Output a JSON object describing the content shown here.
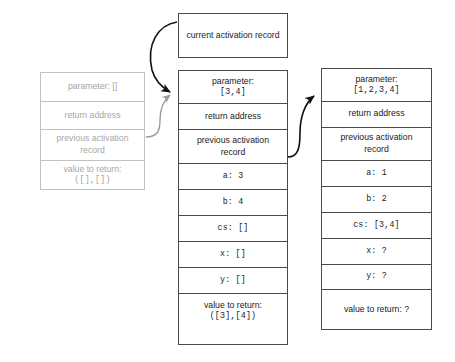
{
  "diagram": {
    "title_box": {
      "label": "current activation record"
    },
    "colors": {
      "active_border": "#4a4a4a",
      "ghost_border": "#c2c2c2",
      "active_text": "#1b1b1b",
      "ghost_text": "#a6a6a6",
      "arrow_black": "#111111",
      "arrow_grey": "#9b9b9b",
      "background": "#ffffff"
    },
    "frames": [
      {
        "name": "inactive-activation-record",
        "state": "inactive",
        "rows": [
          {
            "name": "parameter",
            "text": "parameter: []",
            "mono_tail": "[]"
          },
          {
            "name": "return-address",
            "text": "return address"
          },
          {
            "name": "previous-activation-record",
            "line1": "previous activation",
            "line2": "record"
          },
          {
            "name": "value-to-return",
            "line1": "value to return:",
            "line2": "([],[])"
          }
        ]
      },
      {
        "name": "middle-activation-record",
        "state": "active",
        "rows": [
          {
            "name": "parameter",
            "line1": "parameter:",
            "line2": "[3,4]"
          },
          {
            "name": "return-address",
            "text": "return address"
          },
          {
            "name": "previous-activation-record",
            "line1": "previous activation",
            "line2": "record"
          },
          {
            "name": "var-a",
            "text": "a: 3"
          },
          {
            "name": "var-b",
            "text": "b: 4"
          },
          {
            "name": "var-cs",
            "text": "cs: []"
          },
          {
            "name": "var-x",
            "text": "x: []"
          },
          {
            "name": "var-y",
            "text": "y: []"
          },
          {
            "name": "value-to-return",
            "line1": "value to return:",
            "line2": "([3],[4])"
          }
        ]
      },
      {
        "name": "right-activation-record",
        "state": "active",
        "rows": [
          {
            "name": "parameter",
            "line1": "parameter:",
            "line2": "[1,2,3,4]"
          },
          {
            "name": "return-address",
            "text": "return address"
          },
          {
            "name": "previous-activation-record",
            "line1": "previous activation",
            "line2": "record"
          },
          {
            "name": "var-a",
            "text": "a: 1"
          },
          {
            "name": "var-b",
            "text": "b: 2"
          },
          {
            "name": "var-cs",
            "text": "cs: [3,4]"
          },
          {
            "name": "var-x",
            "text": "x: ?"
          },
          {
            "name": "var-y",
            "text": "y: ?"
          },
          {
            "name": "value-to-return",
            "text": "value to return: ?"
          }
        ]
      }
    ],
    "arrows": [
      {
        "name": "arrow-current-to-middle",
        "color": "black",
        "from": "current activation record",
        "to": "middle parameter cell"
      },
      {
        "name": "arrow-ghost-prev-to-middle",
        "color": "grey",
        "from": "inactive previous activation record",
        "to": "middle parameter cell"
      },
      {
        "name": "arrow-middle-prev-to-right",
        "color": "black",
        "from": "middle previous activation record",
        "to": "right parameter cell"
      }
    ]
  }
}
